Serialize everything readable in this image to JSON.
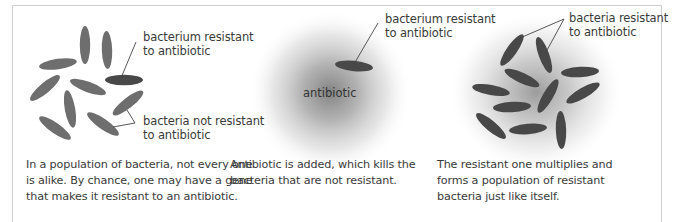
{
  "colors": {
    "border": "#cfcfcf",
    "bacterium_normal": "#6e6e6e",
    "bacterium_resistant": "#484848",
    "antibiotic_cloud": "#8a8a8a",
    "text": "#3a3a3a",
    "leader_line": "#444444"
  },
  "panels": [
    {
      "labels": [
        {
          "line1": "bacterium resistant",
          "line2": "to antibiotic"
        },
        {
          "line1": "bacteria not resistant",
          "line2": "to antibiotic"
        }
      ],
      "caption": [
        "In a population of bacteria, not every one",
        "is alike. By chance, one may have a gene",
        "that makes it resistant to an antibiotic."
      ]
    },
    {
      "center_label": "antibiotic",
      "labels": [
        {
          "line1": "bacterium resistant",
          "line2": "to antibiotic"
        }
      ],
      "caption": [
        "Antibiotic is added, which kills the",
        "bacteria that are not resistant."
      ]
    },
    {
      "labels": [
        {
          "line1": "bacteria resistant",
          "line2": "to antibiotic"
        }
      ],
      "caption": [
        "The resistant one multiplies and",
        "forms a population of resistant",
        "bacteria just like itself."
      ]
    }
  ],
  "bacteria": {
    "panel1": [
      {
        "x": 85,
        "y": 45,
        "a": 90,
        "r": false
      },
      {
        "x": 107,
        "y": 50,
        "a": 88,
        "r": false
      },
      {
        "x": 58,
        "y": 64,
        "a": -8,
        "r": false
      },
      {
        "x": 124,
        "y": 80,
        "a": 0,
        "r": true
      },
      {
        "x": 45,
        "y": 88,
        "a": -40,
        "r": false
      },
      {
        "x": 88,
        "y": 87,
        "a": 20,
        "r": false
      },
      {
        "x": 70,
        "y": 109,
        "a": 80,
        "r": false
      },
      {
        "x": 128,
        "y": 103,
        "a": -38,
        "r": false
      },
      {
        "x": 55,
        "y": 128,
        "a": 35,
        "r": false
      },
      {
        "x": 103,
        "y": 124,
        "a": 35,
        "r": false
      }
    ],
    "panel2": [
      {
        "x": 354,
        "y": 66,
        "a": 6,
        "r": true
      }
    ],
    "panel3": [
      {
        "x": 512,
        "y": 50,
        "a": -55,
        "r": true
      },
      {
        "x": 544,
        "y": 55,
        "a": 70,
        "r": true
      },
      {
        "x": 522,
        "y": 78,
        "a": 25,
        "r": true
      },
      {
        "x": 580,
        "y": 72,
        "a": -3,
        "r": true
      },
      {
        "x": 491,
        "y": 90,
        "a": 10,
        "r": true
      },
      {
        "x": 548,
        "y": 96,
        "a": -60,
        "r": true
      },
      {
        "x": 583,
        "y": 93,
        "a": -30,
        "r": true
      },
      {
        "x": 512,
        "y": 107,
        "a": -3,
        "r": true
      },
      {
        "x": 491,
        "y": 126,
        "a": 40,
        "r": true
      },
      {
        "x": 528,
        "y": 129,
        "a": -5,
        "r": true
      },
      {
        "x": 561,
        "y": 130,
        "a": 88,
        "r": true
      }
    ]
  }
}
